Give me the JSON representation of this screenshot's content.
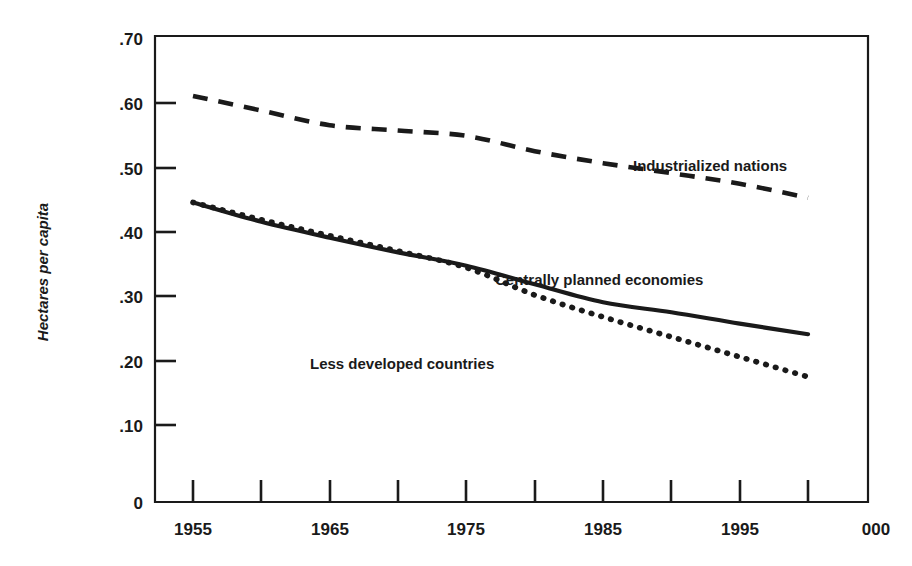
{
  "chart_data": {
    "type": "line",
    "title": "",
    "xlabel": "",
    "ylabel": "Hectares per capita",
    "xlim": [
      1955,
      2000
    ],
    "ylim": [
      0,
      0.7
    ],
    "grid": false,
    "legend_position": "inline-annotations",
    "x_ticks": [
      1955,
      1960,
      1965,
      1970,
      1975,
      1980,
      1985,
      1990,
      1995,
      2000
    ],
    "x_tick_labels": [
      "1955",
      "",
      "1965",
      "",
      "1975",
      "",
      "1985",
      "",
      "1995",
      "2000"
    ],
    "x_tick_labels_visible": [
      "1955",
      "1965",
      "1975",
      "1985",
      "1995",
      "2000"
    ],
    "y_ticks": [
      0,
      0.1,
      0.2,
      0.3,
      0.4,
      0.5,
      0.6,
      0.7
    ],
    "y_tick_labels": [
      "0",
      ".10",
      ".20",
      ".30",
      ".40",
      ".50",
      ".60",
      ".70"
    ],
    "x": [
      1955,
      1960,
      1965,
      1970,
      1975,
      1980,
      1985,
      1990,
      1995,
      2000
    ],
    "series": [
      {
        "name": "Industrialized nations",
        "style": "dashed",
        "color": "#1a1a1a",
        "values": [
          0.61,
          0.588,
          0.566,
          0.558,
          0.55,
          0.527,
          0.509,
          0.494,
          0.478,
          0.457
        ]
      },
      {
        "name": "Centrally planned economies",
        "style": "solid",
        "color": "#1a1a1a",
        "values": [
          0.45,
          0.421,
          0.397,
          0.375,
          0.355,
          0.327,
          0.3,
          0.285,
          0.268,
          0.252
        ]
      },
      {
        "name": "Less developed countries",
        "style": "dotted",
        "color": "#1a1a1a",
        "values": [
          0.45,
          0.424,
          0.4,
          0.377,
          0.352,
          0.311,
          0.278,
          0.248,
          0.218,
          0.188
        ]
      }
    ],
    "annotations": [
      {
        "text": "Industrialized nations",
        "x": 1985,
        "y": 0.525
      },
      {
        "text": "Centrally planned economies",
        "x": 1978,
        "y": 0.325
      },
      {
        "text": "Less developed countries",
        "x": 1972,
        "y": 0.232
      }
    ]
  },
  "axis": {
    "y_title": "Hectares per capita",
    "y_labels": {
      "t70": ".70",
      "t60": ".60",
      "t50": ".50",
      "t40": ".40",
      "t30": ".30",
      "t20": ".20",
      "t10": ".10",
      "t0": "0"
    },
    "x_labels": {
      "x1955": "1955",
      "x1965": "1965",
      "x1975": "1975",
      "x1985": "1985",
      "x1995": "1995",
      "x2000": "000"
    }
  },
  "labels": {
    "industrialized": "Industrialized nations",
    "centrally_planned": "Centrally planned economies",
    "less_developed": "Less developed countries"
  },
  "colors": {
    "ink": "#1a1a1a",
    "background": "#ffffff"
  }
}
